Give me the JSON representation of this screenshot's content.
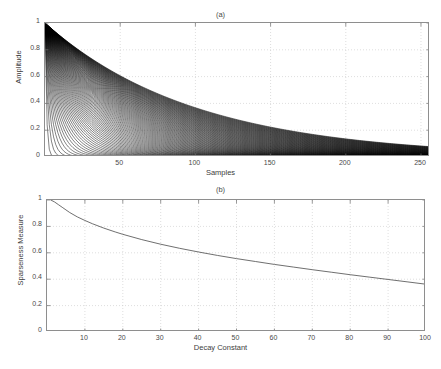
{
  "header": {
    "running_text": ""
  },
  "figure": {
    "panels": [
      {
        "key": "panel_a",
        "title": "(a)"
      },
      {
        "key": "panel_b",
        "title": "(b)"
      }
    ]
  },
  "chart_data": [
    {
      "id": "panel-a",
      "type": "line",
      "title": "(a)",
      "xlabel": "Samples",
      "ylabel": "Amplitude",
      "xlim": [
        0,
        256
      ],
      "ylim": [
        0,
        1
      ],
      "xticks": [
        50,
        100,
        150,
        200,
        250
      ],
      "yticks": [
        0,
        0.2,
        0.4,
        0.6,
        0.8,
        1
      ],
      "xtick_labels": [
        "50",
        "100",
        "150",
        "200",
        "250"
      ],
      "ytick_labels": [
        "0",
        "0.2",
        "0.4",
        "0.6",
        "0.8",
        "1"
      ],
      "grid": true,
      "description": "Family of exponentially decaying envelopes exp(-n/tau) for many decay constants tau, plotted versus sample index n; overlapping curves form a dense black wedge.",
      "series_family": {
        "name": "exp(-n/tau)",
        "tau_min": 1,
        "tau_max": 100,
        "tau_count": 100,
        "n_min": 0,
        "n_max": 256,
        "color": "#000000"
      },
      "envelope_upper": {
        "name": "tau = 100",
        "x": [
          0,
          25,
          50,
          75,
          100,
          125,
          150,
          175,
          200,
          225,
          250,
          256
        ],
        "y": [
          1.0,
          0.78,
          0.61,
          0.47,
          0.37,
          0.29,
          0.22,
          0.17,
          0.14,
          0.11,
          0.08,
          0.08
        ]
      },
      "envelope_lower": {
        "name": "tau = 1",
        "x": [
          0,
          5,
          10,
          20,
          40,
          80,
          160,
          256
        ],
        "y": [
          1.0,
          0.007,
          0.0,
          0.0,
          0.0,
          0.0,
          0.0,
          0.0
        ]
      }
    },
    {
      "id": "panel-b",
      "type": "line",
      "title": "(b)",
      "xlabel": "Decay Constant",
      "ylabel": "Sparseness Measure",
      "xlim": [
        0,
        100
      ],
      "ylim": [
        0,
        1
      ],
      "xticks": [
        10,
        20,
        30,
        40,
        50,
        60,
        70,
        80,
        90,
        100
      ],
      "yticks": [
        0,
        0.2,
        0.4,
        0.6,
        0.8,
        1
      ],
      "xtick_labels": [
        "10",
        "20",
        "30",
        "40",
        "50",
        "60",
        "70",
        "80",
        "90",
        "100"
      ],
      "ytick_labels": [
        "0",
        "0.2",
        "0.4",
        "0.6",
        "0.8",
        "1"
      ],
      "grid": true,
      "description": "Monotonically decreasing sparseness measure as a function of the exponential decay constant.",
      "series": [
        {
          "name": "Sparseness Measure",
          "color": "#4a4a4a",
          "x": [
            1,
            2,
            3,
            4,
            5,
            6,
            8,
            10,
            12,
            15,
            18,
            20,
            25,
            30,
            35,
            40,
            45,
            50,
            55,
            60,
            65,
            70,
            75,
            80,
            85,
            90,
            95,
            100
          ],
          "y": [
            1.0,
            0.985,
            0.965,
            0.945,
            0.925,
            0.905,
            0.872,
            0.845,
            0.82,
            0.787,
            0.758,
            0.74,
            0.7,
            0.665,
            0.634,
            0.606,
            0.58,
            0.556,
            0.534,
            0.512,
            0.492,
            0.472,
            0.453,
            0.434,
            0.416,
            0.398,
            0.38,
            0.362
          ]
        }
      ]
    }
  ],
  "colors": {
    "axis": "#8e8e8e",
    "grid": "#c8c8c8",
    "curve": "#4a4a4a",
    "fill": "#000000",
    "text": "#3d3d3d",
    "background": "#ffffff"
  }
}
